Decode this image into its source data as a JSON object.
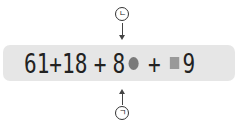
{
  "expression": {
    "tokens": [
      "61",
      "+",
      "18",
      "+",
      "8",
      "●",
      "+",
      "■",
      "9"
    ],
    "part1": "61",
    "op1": "+",
    "part2": "18",
    "op2": "+",
    "part3_digit": "8",
    "op3": "+",
    "part4_digit": "9"
  },
  "markers": {
    "top": {
      "label": "ㄴ",
      "direction": "down"
    },
    "bottom": {
      "label": "ㄱ",
      "direction": "up"
    }
  },
  "colors": {
    "bar": "#e6e6e6",
    "circle": "#7a7a7a",
    "square": "#999999",
    "text": "#222222"
  }
}
